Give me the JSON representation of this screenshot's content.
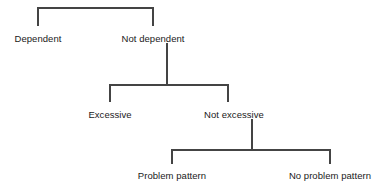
{
  "diagram": {
    "type": "decision-tree",
    "orientation": "top-down",
    "line_color": "#444444",
    "text_color": "#1a1a1a",
    "background_color": "#ffffff",
    "levels": [
      {
        "level": 1,
        "nodes": [
          {
            "id": "dependent",
            "label": "Dependent",
            "x": 38,
            "y": 38
          },
          {
            "id": "not-dependent",
            "label": "Not dependent",
            "x": 153,
            "y": 38
          }
        ]
      },
      {
        "level": 2,
        "parent": "not-dependent",
        "nodes": [
          {
            "id": "excessive",
            "label": "Excessive",
            "x": 110,
            "y": 114
          },
          {
            "id": "not-excessive",
            "label": "Not excessive",
            "x": 234,
            "y": 114
          }
        ]
      },
      {
        "level": 3,
        "parent": "not-excessive",
        "nodes": [
          {
            "id": "problem-pattern",
            "label": "Problem pattern",
            "x": 172,
            "y": 175
          },
          {
            "id": "no-problem-pattern",
            "label": "No problem pattern",
            "x": 330,
            "y": 175
          }
        ]
      }
    ],
    "connectors": [
      {
        "id": "bracket-level-1",
        "left_x": 38,
        "right_x": 153,
        "bar_y": 8,
        "drop_to_y": 26
      },
      {
        "id": "stem-not-dependent",
        "x": 167,
        "from_y": 43,
        "to_y": 85
      },
      {
        "id": "bracket-level-2",
        "left_x": 110,
        "right_x": 228,
        "bar_y": 85,
        "drop_to_y": 102
      },
      {
        "id": "stem-not-excessive",
        "x": 252,
        "from_y": 119,
        "to_y": 150
      },
      {
        "id": "bracket-level-3",
        "left_x": 172,
        "right_x": 330,
        "bar_y": 150,
        "drop_to_y": 164
      }
    ],
    "labels": {
      "dependent": "Dependent",
      "not_dependent": "Not dependent",
      "excessive": "Excessive",
      "not_excessive": "Not excessive",
      "problem_pattern": "Problem pattern",
      "no_problem_pattern": "No problem pattern"
    }
  }
}
